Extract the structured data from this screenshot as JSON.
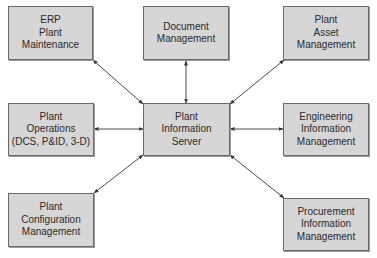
{
  "diagram": {
    "center": {
      "id": "pis",
      "lines": [
        "Plant",
        "Information",
        "Server"
      ]
    },
    "nodes": [
      {
        "id": "erp",
        "lines": [
          "ERP",
          "Plant",
          "Maintenance"
        ]
      },
      {
        "id": "doc",
        "lines": [
          "Document",
          "Management"
        ]
      },
      {
        "id": "asset",
        "lines": [
          "Plant",
          "Asset",
          "Management"
        ]
      },
      {
        "id": "ops",
        "lines": [
          "Plant",
          "Operations",
          "(DCS, P&ID, 3-D)"
        ]
      },
      {
        "id": "eng",
        "lines": [
          "Engineering",
          "Information",
          "Management"
        ]
      },
      {
        "id": "config",
        "lines": [
          "Plant",
          "Configuration",
          "Management"
        ]
      },
      {
        "id": "proc",
        "lines": [
          "Procurement",
          "Information",
          "Management"
        ]
      }
    ],
    "edges": [
      {
        "from": "pis",
        "to": "erp",
        "arrows": "both"
      },
      {
        "from": "pis",
        "to": "doc",
        "arrows": "both"
      },
      {
        "from": "pis",
        "to": "asset",
        "arrows": "both"
      },
      {
        "from": "pis",
        "to": "ops",
        "arrows": "both"
      },
      {
        "from": "pis",
        "to": "eng",
        "arrows": "both"
      },
      {
        "from": "pis",
        "to": "config",
        "arrows": "both"
      },
      {
        "from": "pis",
        "to": "proc",
        "arrows": "both"
      }
    ],
    "colors": {
      "box_fill": "#d6d6d6",
      "box_border": "#6a6a6a",
      "line": "#4a4a4a",
      "text": "#2a2a2a"
    }
  }
}
